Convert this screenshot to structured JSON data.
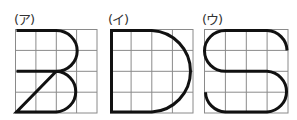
{
  "figures": [
    {
      "label": "(ア)",
      "letter": "B",
      "grid": {
        "x": 15,
        "y": 29,
        "w": 82,
        "h": 84,
        "cols": 4,
        "rows": 4
      }
    },
    {
      "label": "(イ)",
      "letter": "D",
      "grid": {
        "x": 110,
        "y": 29,
        "w": 83,
        "h": 84,
        "cols": 4,
        "rows": 4
      }
    },
    {
      "label": "(ウ)",
      "letter": "S",
      "grid": {
        "x": 204,
        "y": 29,
        "w": 84,
        "h": 84,
        "cols": 4,
        "rows": 4
      }
    }
  ],
  "colors": {
    "grid": "#8a8a8a",
    "stroke": "#111111"
  }
}
